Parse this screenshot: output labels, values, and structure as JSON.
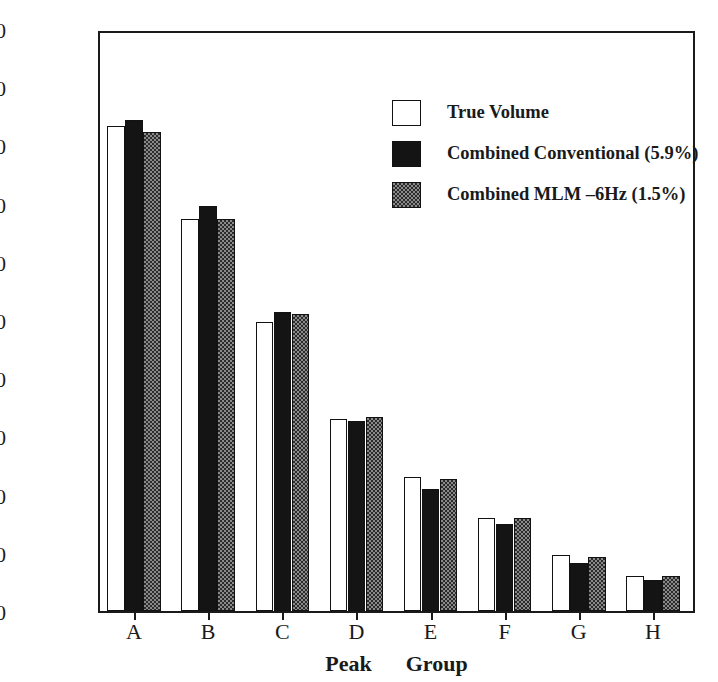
{
  "chart_data": {
    "type": "bar",
    "title": "",
    "xlabel": "Peak   Group",
    "xlabel_word_1": "Peak",
    "xlabel_word_2": "Group",
    "ylabel": "Normalized Peak–Volume",
    "categories": [
      "A",
      "B",
      "C",
      "D",
      "E",
      "F",
      "G",
      "H"
    ],
    "ylim": [
      0,
      300
    ],
    "yticks": [
      0,
      30,
      60,
      90,
      120,
      150,
      180,
      210,
      240,
      270,
      300
    ],
    "grid": false,
    "legend_position": "upper right",
    "series": [
      {
        "name": "True Volume",
        "fill": "white",
        "color": "#ffffff",
        "values": [
          250,
          202,
          149,
          99,
          69,
          48,
          29,
          18
        ]
      },
      {
        "name": "Combined Conventional (5.9%)",
        "fill": "solid-black",
        "color": "#141414",
        "values": [
          253,
          209,
          154,
          98,
          63,
          45,
          25,
          16
        ]
      },
      {
        "name": "Combined MLM –6Hz (1.5%)",
        "fill": "gray-hatch",
        "color": "#8a8a8a",
        "values": [
          247,
          202,
          153,
          100,
          68,
          48,
          28,
          18
        ]
      }
    ]
  }
}
